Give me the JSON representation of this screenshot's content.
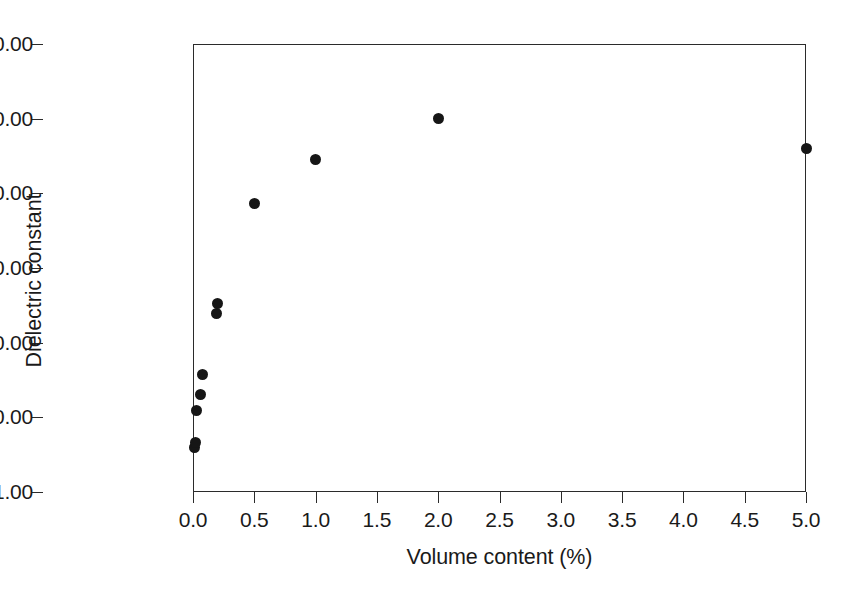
{
  "chart_data": {
    "type": "scatter",
    "title": "",
    "xlabel": "Volume content  (%)",
    "ylabel": "Dielectric constant",
    "xlim": [
      0.0,
      5.0
    ],
    "ylim": [
      1.0,
      1000000.0
    ],
    "yscale": "log",
    "xscale": "linear",
    "grid": false,
    "legend": null,
    "xticks": [
      "0.0",
      "0.5",
      "1.0",
      "1.5",
      "2.0",
      "2.5",
      "3.0",
      "3.5",
      "4.0",
      "4.5",
      "5.0"
    ],
    "xtick_values": [
      0.0,
      0.5,
      1.0,
      1.5,
      2.0,
      2.5,
      3.0,
      3.5,
      4.0,
      4.5,
      5.0
    ],
    "yticks": [
      "1.00",
      "10.00",
      "100.00",
      "1000.00",
      "10000.00",
      "100000.00",
      "1000000.00"
    ],
    "ytick_values": [
      1,
      10,
      100,
      1000,
      10000,
      100000,
      1000000
    ],
    "marker": "filled-circle",
    "marker_color": "#161616",
    "points": [
      {
        "x": 0.01,
        "y": 3.9
      },
      {
        "x": 0.02,
        "y": 4.6
      },
      {
        "x": 0.03,
        "y": 12.5
      },
      {
        "x": 0.06,
        "y": 20.0
      },
      {
        "x": 0.08,
        "y": 37.0
      },
      {
        "x": 0.19,
        "y": 245.0
      },
      {
        "x": 0.2,
        "y": 330.0
      },
      {
        "x": 0.5,
        "y": 7300.0
      },
      {
        "x": 1.0,
        "y": 28000.0
      },
      {
        "x": 2.0,
        "y": 100000.0
      },
      {
        "x": 5.0,
        "y": 40000.0
      }
    ]
  },
  "figure": {
    "background_color": "#ffffff",
    "frame_color": "#2b2b2b"
  }
}
